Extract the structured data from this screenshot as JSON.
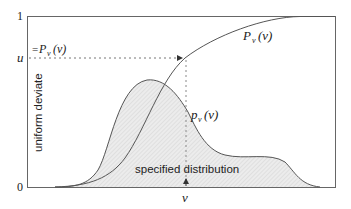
{
  "figure": {
    "y_axis": {
      "label": "uniform deviate",
      "tick_top": "1",
      "tick_bottom": "0",
      "tick_u": "u"
    },
    "x_axis": {
      "tick_v": "v"
    },
    "labels": {
      "cdf_eq_prefix": "=",
      "cdf_P": "P",
      "cdf_sub": "v",
      "cdf_arg": "(v)",
      "cdf_curve_P": "P",
      "cdf_curve_sub": "v",
      "cdf_curve_arg": "(v)",
      "pdf_p": "p",
      "pdf_sub": "v",
      "pdf_arg": "(v)",
      "distribution": "specified distribution"
    },
    "colors": {
      "line": "#555555",
      "fill": "#e6e6e6",
      "frame": "#666666",
      "dotted": "#777777"
    }
  }
}
